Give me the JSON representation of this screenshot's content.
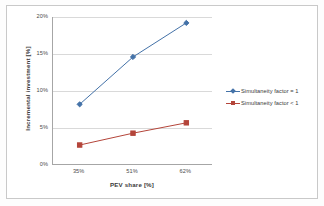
{
  "chart_data": {
    "type": "line",
    "title": "",
    "xlabel": "PEV share [%]",
    "ylabel": "Incremental investment [%]",
    "categories": [
      "35%",
      "51%",
      "62%"
    ],
    "ylim": [
      0,
      20
    ],
    "yticks": [
      "0%",
      "5%",
      "10%",
      "15%",
      "20%"
    ],
    "ytick_values": [
      0,
      5,
      10,
      15,
      20
    ],
    "grid": true,
    "legend_position": "right",
    "series": [
      {
        "name": "Simultaneity factor = 1",
        "color": "#4472a8",
        "marker": "diamond",
        "values": [
          8.2,
          14.6,
          19.2
        ]
      },
      {
        "name": "Simultaneity factor < 1",
        "color": "#b4453a",
        "marker": "square",
        "values": [
          2.7,
          4.3,
          5.7
        ]
      }
    ]
  },
  "axis": {
    "x_title": "PEV share [%]",
    "y_title": "Incremental investment [%]"
  }
}
